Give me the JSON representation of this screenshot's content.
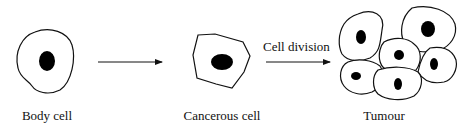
{
  "diagram": {
    "stages": [
      {
        "id": "body-cell",
        "label": "Body cell"
      },
      {
        "id": "cancerous-cell",
        "label": "Cancerous cell"
      },
      {
        "id": "tumour",
        "label": "Tumour"
      }
    ],
    "arrows": [
      {
        "from": "body-cell",
        "to": "cancerous-cell",
        "label": ""
      },
      {
        "from": "cancerous-cell",
        "to": "tumour",
        "label": "Cell division"
      }
    ],
    "colors": {
      "outline": "#111111",
      "nucleus": "#000000",
      "background": "#ffffff"
    }
  }
}
